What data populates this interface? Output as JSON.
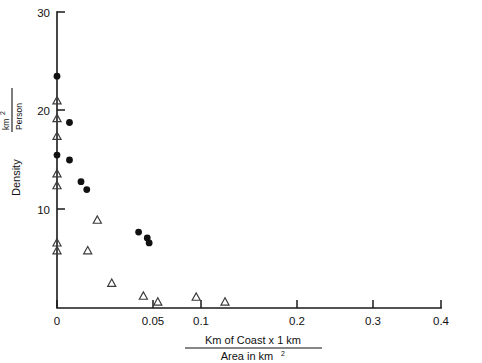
{
  "figure": {
    "background": "#ffffff",
    "ink_color": "#111111",
    "marker_filled_color": "#111111",
    "marker_open_color": "#3a3a3a"
  },
  "chart_data": {
    "type": "scatter",
    "title": "",
    "xlabel_numerator": "Km  of Coast x 1 km",
    "xlabel_denominator": "Area in  km",
    "xlabel_denominator_sup": "2",
    "ylabel_main": "Density",
    "ylabel_fraction_numerator": "km",
    "ylabel_fraction_numerator_sup": "2",
    "ylabel_fraction_denominator": "Person",
    "xlim": [
      0,
      0.4
    ],
    "ylim": [
      0,
      30
    ],
    "xticks": [
      0,
      0.05,
      0.1,
      0.2,
      0.3,
      0.4
    ],
    "xticklabels": [
      "0",
      "0.05",
      "0.1",
      "0.2",
      "0.3",
      "0.4"
    ],
    "yticks": [
      10,
      20,
      30
    ],
    "yticklabels": [
      "10",
      "20",
      "30"
    ],
    "grid": false,
    "legend": "none",
    "series": [
      {
        "name": "filled-circles",
        "marker": "circle-filled",
        "points": [
          [
            0.0,
            23.5
          ],
          [
            0.0,
            15.5
          ],
          [
            0.013,
            18.8
          ],
          [
            0.013,
            15.0
          ],
          [
            0.025,
            12.8
          ],
          [
            0.031,
            12.0
          ],
          [
            0.085,
            7.7
          ],
          [
            0.094,
            7.1
          ],
          [
            0.096,
            6.6
          ]
        ]
      },
      {
        "name": "open-triangles",
        "marker": "triangle-open",
        "points": [
          [
            0.0,
            21.0
          ],
          [
            0.0,
            19.2
          ],
          [
            0.0,
            17.4
          ],
          [
            0.0,
            13.6
          ],
          [
            0.0,
            12.4
          ],
          [
            0.0,
            6.6
          ],
          [
            0.0,
            5.8
          ],
          [
            0.032,
            5.8
          ],
          [
            0.042,
            8.9
          ],
          [
            0.057,
            2.5
          ],
          [
            0.09,
            1.2
          ],
          [
            0.105,
            0.6
          ],
          [
            0.145,
            1.1
          ],
          [
            0.175,
            0.6
          ]
        ]
      }
    ]
  }
}
